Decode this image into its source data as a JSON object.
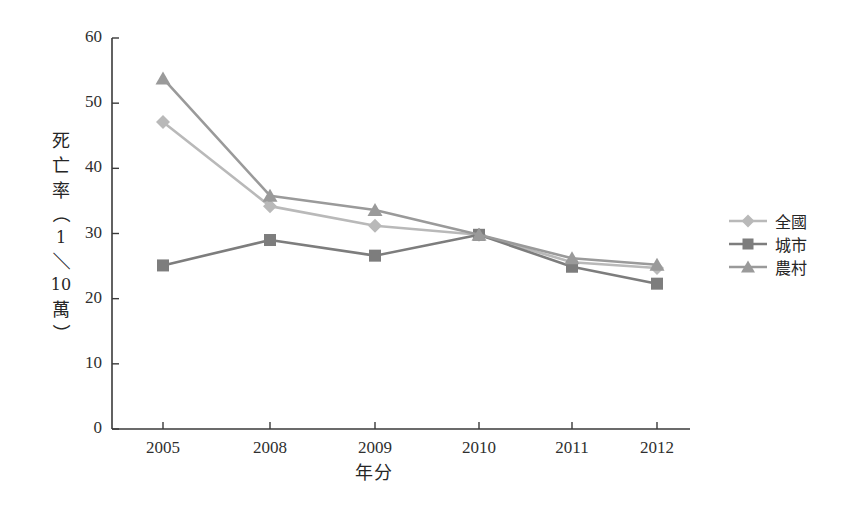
{
  "chart_data": {
    "type": "line",
    "title": "",
    "xlabel": "年分",
    "ylabel": "死亡率（1／10萬）",
    "categories": [
      "2005",
      "2008",
      "2009",
      "2010",
      "2011",
      "2012"
    ],
    "ylim": [
      0,
      60
    ],
    "yticks": [
      0,
      10,
      20,
      30,
      40,
      50,
      60
    ],
    "ytick_labels": [
      "0",
      "10",
      "20",
      "30",
      "40",
      "50",
      "60"
    ],
    "grid": false,
    "legend_position": "right",
    "series": [
      {
        "name": "全國",
        "marker": "diamond",
        "color": "#b9b9b9",
        "values": [
          47.1,
          34.2,
          31.2,
          29.8,
          25.6,
          24.7
        ]
      },
      {
        "name": "城市",
        "marker": "square",
        "color": "#7d7d7d",
        "values": [
          25.1,
          29.0,
          26.6,
          29.8,
          24.9,
          22.3
        ]
      },
      {
        "name": "農村",
        "marker": "triangle",
        "color": "#9a9a9a",
        "values": [
          53.8,
          35.8,
          33.6,
          29.8,
          26.2,
          25.2
        ]
      }
    ]
  },
  "axis": {
    "y_title_chars": [
      "死",
      "亡",
      "率",
      "（",
      "1",
      "／",
      "10",
      "萬",
      "）"
    ],
    "axis_color": "#3a3a3a"
  },
  "legend": {
    "items": [
      {
        "label": "全國",
        "marker": "diamond",
        "color": "#b9b9b9"
      },
      {
        "label": "城市",
        "marker": "square",
        "color": "#7d7d7d"
      },
      {
        "label": "農村",
        "marker": "triangle",
        "color": "#9a9a9a"
      }
    ]
  }
}
